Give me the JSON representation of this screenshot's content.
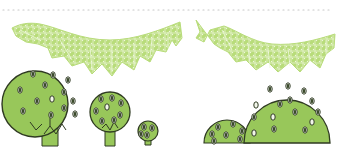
{
  "illustration": {
    "description": "Decorative illustration: dotted border line, two lacy leaf garlands, three round trees and two half-dome bushes",
    "colors": {
      "background": "#ffffff",
      "dots": "#c8c8c8",
      "garland": "#b8dc7a",
      "garland_vein": "#f4fae6",
      "foliage_fill": "#98c75a",
      "outline": "#2f3a22",
      "leaf_dark": "#3a4a2a",
      "leaf_light": "#f2f6ea",
      "trunk": "#98c75a"
    },
    "dotted_line": {
      "y": 10,
      "x_start": 3,
      "x_end": 332
    },
    "garlands": [
      {
        "id": "garland-left",
        "x_start": 12,
        "x_end": 180
      },
      {
        "id": "garland-right",
        "x_start": 196,
        "x_end": 335
      }
    ],
    "trees": [
      {
        "id": "tree-large",
        "cx": 35,
        "cy": 104,
        "r": 33
      },
      {
        "id": "tree-medium",
        "cx": 110,
        "cy": 112,
        "r": 20
      },
      {
        "id": "tree-small",
        "cx": 148,
        "cy": 131,
        "r": 10
      }
    ],
    "bushes": [
      {
        "id": "bush-small",
        "cx": 227,
        "cy": 143,
        "r": 23
      },
      {
        "id": "bush-large",
        "cx": 286,
        "cy": 143,
        "r": 44
      }
    ]
  }
}
